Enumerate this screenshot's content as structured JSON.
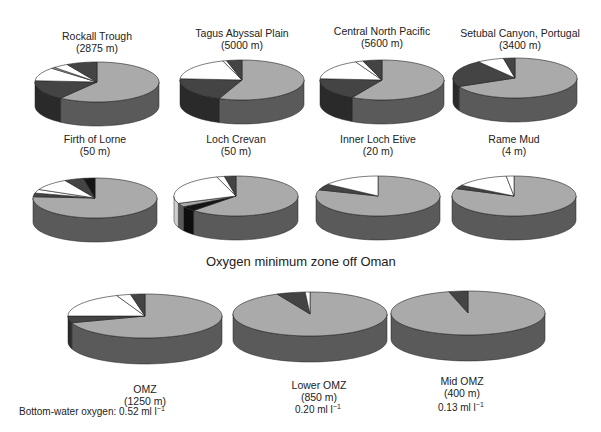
{
  "chart_data": {
    "type": "pie",
    "style": "3d-pie",
    "colors": {
      "light_gray": "#aaaaaa",
      "dark_gray": "#444444",
      "black": "#141414",
      "white": "#ffffff",
      "side_light_gray": "#5a5a5a",
      "side_dark": "#2a2a2a",
      "side_black": "#0e0e0e"
    },
    "legend": [],
    "note": "Slice values are approximate proportions (%) estimated from pie geometry; order is clockwise from 12 o'clock.",
    "groups": [
      {
        "title": "",
        "pies": [
          {
            "name": "Rockall Trough",
            "depth": "(2875 m)",
            "cx": 97,
            "cy": 82,
            "slices": [
              {
                "color": "light_gray",
                "value": 60
              },
              {
                "color": "dark_gray",
                "value": 16
              },
              {
                "color": "white",
                "value": 11
              },
              {
                "color": "light_gray_outline",
                "value": 1
              },
              {
                "color": "white",
                "value": 4
              },
              {
                "color": "dark_gray",
                "value": 8
              }
            ]
          },
          {
            "name": "Tagus Abyssal Plain",
            "depth": "(5000 m)",
            "cx": 242,
            "cy": 80,
            "slices": [
              {
                "color": "light_gray",
                "value": 56
              },
              {
                "color": "dark_gray",
                "value": 20
              },
              {
                "color": "white",
                "value": 19
              },
              {
                "color": "white",
                "value": 1
              },
              {
                "color": "dark_gray",
                "value": 4
              }
            ]
          },
          {
            "name": "Central North Pacific",
            "depth": "(5600 m)",
            "cx": 382,
            "cy": 80,
            "slices": [
              {
                "color": "light_gray",
                "value": 58
              },
              {
                "color": "dark_gray",
                "value": 18
              },
              {
                "color": "white",
                "value": 17
              },
              {
                "color": "white",
                "value": 2
              },
              {
                "color": "dark_gray",
                "value": 5
              }
            ]
          },
          {
            "name": "Setubal Canyon, Portugal",
            "depth": "(3400 m)",
            "cx": 515,
            "cy": 78,
            "slices": [
              {
                "color": "light_gray",
                "value": 68
              },
              {
                "color": "dark_gray",
                "value": 22
              },
              {
                "color": "white",
                "value": 7
              },
              {
                "color": "dark_gray",
                "value": 3
              }
            ]
          }
        ]
      },
      {
        "title": "",
        "pies": [
          {
            "name": "Firth of Lorne",
            "depth": "(50 m)",
            "cx": 95,
            "cy": 198,
            "slices": [
              {
                "color": "light_gray",
                "value": 76
              },
              {
                "color": "dark_gray",
                "value": 3
              },
              {
                "color": "white",
                "value": 3
              },
              {
                "color": "white",
                "value": 10
              },
              {
                "color": "dark_gray",
                "value": 5
              },
              {
                "color": "black",
                "value": 3
              }
            ]
          },
          {
            "name": "Loch Crevan",
            "depth": "(50 m)",
            "cx": 236,
            "cy": 196,
            "slices": [
              {
                "color": "light_gray",
                "value": 62
              },
              {
                "color": "black",
                "value": 4
              },
              {
                "color": "light_gray",
                "value": 3
              },
              {
                "color": "white",
                "value": 26
              },
              {
                "color": "white",
                "value": 2
              },
              {
                "color": "dark_gray",
                "value": 3
              }
            ]
          },
          {
            "name": "Inner Loch Etive",
            "depth": "(20 m)",
            "cx": 378,
            "cy": 196,
            "slices": [
              {
                "color": "light_gray",
                "value": 80
              },
              {
                "color": "dark_gray",
                "value": 5
              },
              {
                "color": "white",
                "value": 15
              }
            ]
          },
          {
            "name": "Rame Mud",
            "depth": "(4 m)",
            "cx": 514,
            "cy": 196,
            "slices": [
              {
                "color": "light_gray",
                "value": 81
              },
              {
                "color": "dark_gray",
                "value": 3
              },
              {
                "color": "white",
                "value": 14
              },
              {
                "color": "white",
                "value": 2
              }
            ]
          }
        ]
      },
      {
        "title": "Oxygen minimum zone off Oman",
        "pies": [
          {
            "name": "OMZ",
            "depth": "(1250 m)",
            "oxygen": "0.52",
            "cx": 145,
            "cy": 316,
            "slices": [
              {
                "color": "light_gray",
                "value": 70
              },
              {
                "color": "dark_gray",
                "value": 5
              },
              {
                "color": "white",
                "value": 19
              },
              {
                "color": "white",
                "value": 3
              },
              {
                "color": "dark_gray",
                "value": 3
              }
            ]
          },
          {
            "name": "Lower OMZ",
            "depth": "(850 m)",
            "oxygen": "0.20",
            "cx": 310,
            "cy": 314,
            "slices": [
              {
                "color": "light_gray",
                "value": 93
              },
              {
                "color": "dark_gray",
                "value": 6
              },
              {
                "color": "white",
                "value": 1
              }
            ]
          },
          {
            "name": "Mid OMZ",
            "depth": "(400 m)",
            "oxygen": "0.13",
            "cx": 468,
            "cy": 313,
            "slices": [
              {
                "color": "light_gray",
                "value": 96
              },
              {
                "color": "dark_gray",
                "value": 4
              }
            ]
          }
        ]
      }
    ],
    "annotations": {
      "oxygen_label": "Bottom-water oxygen:",
      "oxygen_unit": "ml l",
      "oxygen_exponent": "−1"
    }
  },
  "labels": {
    "rockall": {
      "name": "Rockall Trough",
      "depth": "(2875 m)"
    },
    "tagus": {
      "name": "Tagus Abyssal Plain",
      "depth": "(5000 m)"
    },
    "cnp": {
      "name": "Central North Pacific",
      "depth": "(5600 m)"
    },
    "setubal": {
      "name": "Setubal Canyon, Portugal",
      "depth": "(3400 m)"
    },
    "lorne": {
      "name": "Firth of Lorne",
      "depth": "(50 m)"
    },
    "crevan": {
      "name": "Loch Crevan",
      "depth": "(50 m)"
    },
    "etive": {
      "name": "Inner Loch Etive",
      "depth": "(20 m)"
    },
    "rame": {
      "name": "Rame Mud",
      "depth": "(4 m)"
    },
    "omz_title": "Oxygen minimum zone off Oman",
    "omz": {
      "name": "OMZ",
      "depth": "(1250 m)"
    },
    "lower_omz": {
      "name": "Lower OMZ",
      "depth": "(850 m)"
    },
    "mid_omz": {
      "name": "Mid OMZ",
      "depth": "(400 m)"
    },
    "oxygen_prefix": "Bottom-water oxygen:",
    "oxy_omz": "0.52 ml l",
    "oxy_lower": "0.20 ml l",
    "oxy_mid": "0.13 ml l",
    "exp": "−1"
  }
}
